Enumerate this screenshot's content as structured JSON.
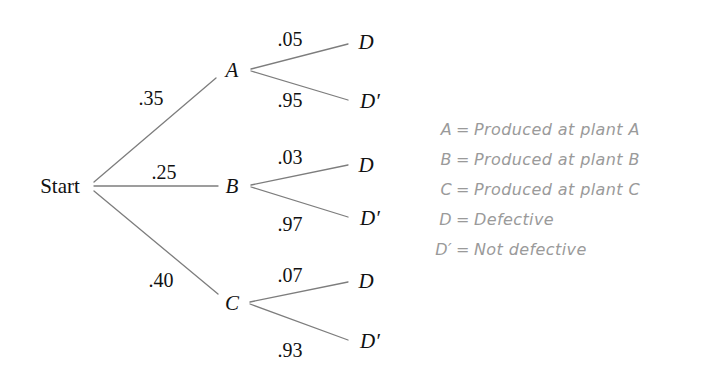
{
  "diagram": {
    "type": "probability-tree",
    "title": "",
    "root": {
      "label": "Start",
      "x": 60,
      "y": 186
    },
    "edge_color": "#7d7d7d",
    "text_color": "#111111",
    "legend_color": "#9a9a9a",
    "background": "#ffffff"
  },
  "nodes": {
    "start": "Start",
    "a": "A",
    "b": "B",
    "c": "C",
    "leaf_d": "D",
    "leaf_dp": "D′"
  },
  "branches": [
    {
      "node": "A",
      "probability": ".35",
      "node_x": 232,
      "node_y": 70,
      "children": [
        {
          "label": "D",
          "probability": ".05",
          "leaf_x": 365,
          "leaf_y": 42
        },
        {
          "label": "D′",
          "probability": ".95",
          "leaf_x": 365,
          "leaf_y": 101
        }
      ]
    },
    {
      "node": "B",
      "probability": ".25",
      "node_x": 232,
      "node_y": 186,
      "children": [
        {
          "label": "D",
          "probability": ".03",
          "leaf_x": 365,
          "leaf_y": 165
        },
        {
          "label": "D′",
          "probability": ".97",
          "leaf_x": 365,
          "leaf_y": 218
        }
      ]
    },
    {
      "node": "C",
      "probability": ".40",
      "node_x": 232,
      "node_y": 303,
      "children": [
        {
          "label": "D",
          "probability": ".07",
          "leaf_x": 365,
          "leaf_y": 281
        },
        {
          "label": "D′",
          "probability": ".93",
          "leaf_x": 365,
          "leaf_y": 341
        }
      ]
    }
  ],
  "probability_labels": {
    "stage1": [
      ".35",
      ".25",
      ".40"
    ],
    "stage2_a": [
      ".05",
      ".95"
    ],
    "stage2_b": [
      ".03",
      ".97"
    ],
    "stage2_c": [
      ".07",
      ".93"
    ]
  },
  "legend": {
    "rows": [
      {
        "key": "A",
        "eq": "=",
        "desc": "Produced at plant A"
      },
      {
        "key": "B",
        "eq": "=",
        "desc": "Produced at plant B"
      },
      {
        "key": "C",
        "eq": "=",
        "desc": "Produced at plant C"
      },
      {
        "key": "D",
        "eq": "=",
        "desc": "Defective"
      },
      {
        "key": "D′",
        "eq": "=",
        "desc": "Not defective"
      }
    ]
  }
}
